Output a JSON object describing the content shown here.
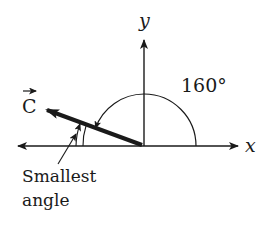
{
  "diagram": {
    "axes": {
      "x_label": "x",
      "y_label": "y"
    },
    "vector": {
      "label": "C",
      "has_arrow_notation": true,
      "direction_angle_deg": 160
    },
    "angle_label": "160°",
    "annotation": {
      "line1": "Smallest",
      "line2": "angle"
    },
    "colors": {
      "ink": "#1a1a1a",
      "background": "#ffffff"
    }
  }
}
